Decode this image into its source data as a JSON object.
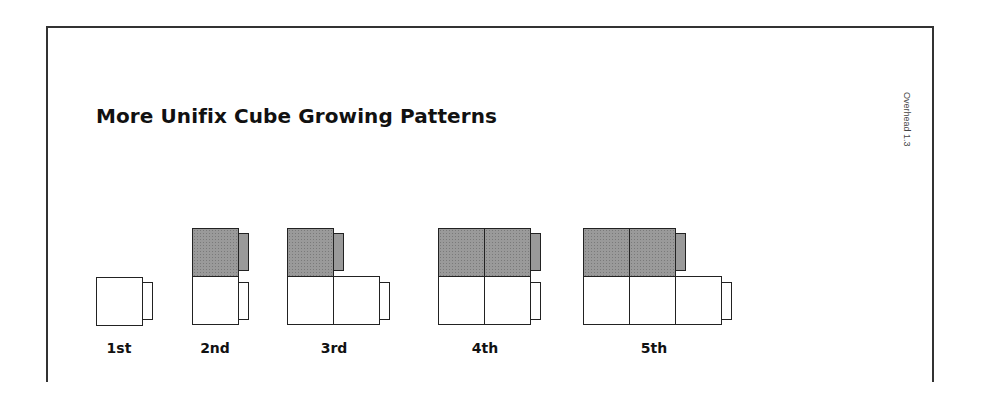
{
  "document": {
    "title": "More Unifix Cube Growing Patterns",
    "side_label": "Overhead 1.3"
  },
  "colors": {
    "shaded_cube": "#9a9a9a",
    "outline": "#222222"
  },
  "patterns": [
    {
      "label": "1st",
      "shaded_cubes": 0,
      "white_cubes": 1
    },
    {
      "label": "2nd",
      "shaded_cubes": 1,
      "white_cubes": 1
    },
    {
      "label": "3rd",
      "shaded_cubes": 1,
      "white_cubes": 2
    },
    {
      "label": "4th",
      "shaded_cubes": 2,
      "white_cubes": 2
    },
    {
      "label": "5th",
      "shaded_cubes": 2,
      "white_cubes": 3
    }
  ]
}
